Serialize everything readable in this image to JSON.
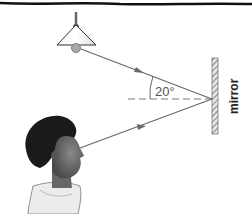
{
  "diagram": {
    "labels": {
      "angle": "20°",
      "mirror": "mirror"
    },
    "elements": {
      "lamp": "ceiling lamp with shade and bulb",
      "incident_ray": "light ray from lamp to mirror",
      "normal": "dashed normal line at mirror",
      "reflected_ray": "light ray from mirror to child's eye",
      "mirror": "hatched plane mirror",
      "observer": "child profile"
    },
    "colors": {
      "ray": "#6a6a6a",
      "outline": "#333333",
      "hatch": "#555555"
    }
  }
}
